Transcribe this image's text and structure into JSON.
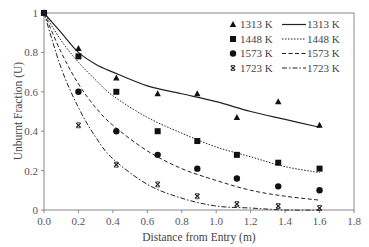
{
  "chart_data": {
    "type": "scatter",
    "title": "",
    "xlabel": "Distance from Entry (m)",
    "ylabel": "Unburnt Fraction (U)",
    "xlim": [
      0,
      1.8
    ],
    "ylim": [
      0,
      1
    ],
    "xticks": [
      "0.0",
      "0.2",
      "0.4",
      "0.6",
      "0.8",
      "1.0",
      "1.2",
      "1.4",
      "1.6",
      "1.8"
    ],
    "yticks": [
      "0",
      "0.2",
      "0.4",
      "0.6",
      "0.8",
      "1"
    ],
    "grid": false,
    "legend_position": "upper right",
    "series": [
      {
        "name": "1313 K",
        "kind": "measured",
        "marker": "triangle",
        "x": [
          0,
          0.2,
          0.42,
          0.66,
          0.89,
          1.12,
          1.36,
          1.6
        ],
        "y": [
          1.0,
          0.82,
          0.67,
          0.59,
          0.59,
          0.47,
          0.55,
          0.43
        ]
      },
      {
        "name": "1448 K",
        "kind": "measured",
        "marker": "square",
        "x": [
          0,
          0.2,
          0.42,
          0.66,
          0.89,
          1.12,
          1.36,
          1.6
        ],
        "y": [
          1.0,
          0.78,
          0.6,
          0.4,
          0.35,
          0.28,
          0.24,
          0.21
        ]
      },
      {
        "name": "1573 K",
        "kind": "measured",
        "marker": "circle",
        "x": [
          0,
          0.2,
          0.42,
          0.66,
          0.89,
          1.12,
          1.36,
          1.6
        ],
        "y": [
          1.0,
          0.6,
          0.4,
          0.28,
          0.21,
          0.16,
          0.12,
          0.1
        ]
      },
      {
        "name": "1723 K",
        "kind": "measured",
        "marker": "x",
        "x": [
          0,
          0.2,
          0.42,
          0.66,
          0.89,
          1.12,
          1.36,
          1.6
        ],
        "y": [
          1.0,
          0.43,
          0.23,
          0.13,
          0.07,
          0.03,
          0.02,
          0.01
        ]
      },
      {
        "name": "1313 K",
        "kind": "model",
        "line": "solid",
        "x": [
          0,
          0.1,
          0.2,
          0.3,
          0.4,
          0.6,
          0.8,
          1.0,
          1.2,
          1.4,
          1.6
        ],
        "y": [
          1.0,
          0.9,
          0.8,
          0.74,
          0.7,
          0.63,
          0.59,
          0.55,
          0.5,
          0.46,
          0.42
        ]
      },
      {
        "name": "1448 K",
        "kind": "model",
        "line": "dotted",
        "x": [
          0,
          0.1,
          0.2,
          0.3,
          0.4,
          0.6,
          0.8,
          1.0,
          1.2,
          1.4,
          1.6
        ],
        "y": [
          1.0,
          0.86,
          0.75,
          0.66,
          0.58,
          0.47,
          0.39,
          0.32,
          0.27,
          0.22,
          0.19
        ]
      },
      {
        "name": "1573 K",
        "kind": "model",
        "line": "dashed",
        "x": [
          0,
          0.1,
          0.2,
          0.3,
          0.4,
          0.6,
          0.8,
          1.0,
          1.2,
          1.4,
          1.6
        ],
        "y": [
          1.0,
          0.8,
          0.64,
          0.52,
          0.43,
          0.3,
          0.21,
          0.15,
          0.1,
          0.07,
          0.05
        ]
      },
      {
        "name": "1723 K",
        "kind": "model",
        "line": "dashdot",
        "x": [
          0,
          0.1,
          0.2,
          0.3,
          0.4,
          0.6,
          0.8,
          1.0,
          1.2,
          1.4,
          1.6
        ],
        "y": [
          1.0,
          0.72,
          0.52,
          0.37,
          0.26,
          0.13,
          0.06,
          0.02,
          0.01,
          0.0,
          0.0
        ]
      }
    ],
    "legend": {
      "markers": [
        "1313 K",
        "1448 K",
        "1573 K",
        "1723 K"
      ],
      "lines": [
        "1313 K",
        "1448 K",
        "1573 K",
        "1723 K"
      ]
    }
  }
}
